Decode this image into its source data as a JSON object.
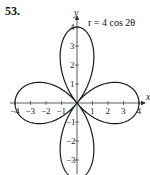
{
  "problem": {
    "number": "53."
  },
  "chart_data": {
    "type": "polar-line",
    "title": "r = 4 cos 2θ",
    "equation": "r = 4 cos 2θ",
    "xlabel": "x",
    "ylabel": "y",
    "xlim": [
      -4,
      4
    ],
    "ylim": [
      -4,
      4
    ],
    "x_ticks": [
      -4,
      -3,
      -2,
      -1,
      1,
      2,
      3,
      4
    ],
    "x_tick_labels": [
      "−4",
      "−3",
      "−2",
      "−1",
      "1",
      "2",
      "3",
      "4"
    ],
    "y_ticks": [
      -4,
      -3,
      -2,
      -1,
      1,
      2,
      3,
      4
    ],
    "y_tick_labels": [
      "−4",
      "−3",
      "−2",
      "−1",
      "1",
      "2",
      "3",
      "4"
    ],
    "grid": false,
    "curve": {
      "name": "four-leaved rose",
      "amplitude": 4,
      "frequency": 2,
      "petals": 4,
      "petal_tips": [
        [
          4,
          0
        ],
        [
          0,
          4
        ],
        [
          -4,
          0
        ],
        [
          0,
          -4
        ]
      ]
    },
    "colors": {
      "curve": "#1a1a1a",
      "axes": "#333333"
    }
  }
}
